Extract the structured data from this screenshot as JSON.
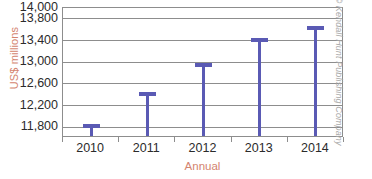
{
  "chart_data": {
    "type": "bar",
    "title": "",
    "subtitle": "",
    "xlabel": "Annual",
    "ylabel": "US$ millions",
    "categories": [
      "2010",
      "2011",
      "2012",
      "2013",
      "2014"
    ],
    "values": [
      11830,
      12410,
      12950,
      13410,
      13640
    ],
    "series": [
      {
        "name": "US$ millions",
        "values": [
          11830,
          12410,
          12950,
          13410,
          13640
        ]
      }
    ],
    "ytick_labels": [
      "14,000",
      "13,800",
      "13,400",
      "13,000",
      "12,600",
      "12,200",
      "11,800"
    ],
    "ytick_values": [
      14000,
      13800,
      13400,
      13000,
      12600,
      12200,
      11800
    ],
    "xtick_labels": [
      "2010",
      "2011",
      "2012",
      "2013",
      "2014"
    ],
    "ylim": [
      11600,
      14000
    ],
    "grid": true,
    "legend": false,
    "legend_position": "none",
    "bar_style": "t-top-lollipop"
  },
  "style": {
    "bar_color": "#5a5ab4",
    "axis_title_color": "#d4846f",
    "tick_label_color": "#2b2b2b",
    "gridline_color": "#8d8d8d",
    "credit_color": "#a8a8a8",
    "background": "#ffffff"
  },
  "credit": {
    "text": "© Kendall Hunt Publishing Company"
  }
}
